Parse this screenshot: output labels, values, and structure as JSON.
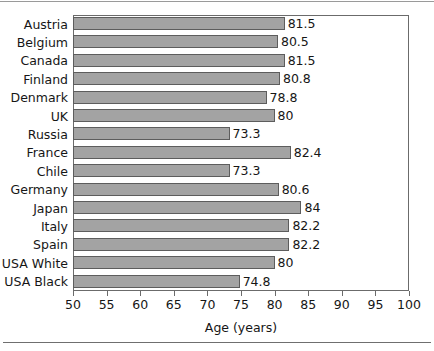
{
  "chart_data": {
    "type": "bar",
    "orientation": "horizontal",
    "title": "",
    "xlabel": "Age (years)",
    "ylabel": "",
    "xlim": [
      50,
      100
    ],
    "xticks": [
      50,
      55,
      60,
      65,
      70,
      75,
      80,
      85,
      90,
      95,
      100
    ],
    "grid": false,
    "legend": false,
    "bar_color": "#a3a3a3",
    "bar_border_color": "#5d5d5d",
    "categories": [
      "Austria",
      "Belgium",
      "Canada",
      "Finland",
      "Denmark",
      "UK",
      "Russia",
      "France",
      "Chile",
      "Germany",
      "Japan",
      "Italy",
      "Spain",
      "USA White",
      "USA Black"
    ],
    "values": [
      81.5,
      80.5,
      81.5,
      80.8,
      78.8,
      80,
      73.3,
      82.4,
      73.3,
      80.6,
      84,
      82.2,
      82.2,
      80,
      74.8
    ],
    "value_labels": [
      "81.5",
      "80.5",
      "81.5",
      "80.8",
      "78.8",
      "80",
      "73.3",
      "82.4",
      "73.3",
      "80.6",
      "84",
      "82.2",
      "82.2",
      "80",
      "74.8"
    ]
  }
}
